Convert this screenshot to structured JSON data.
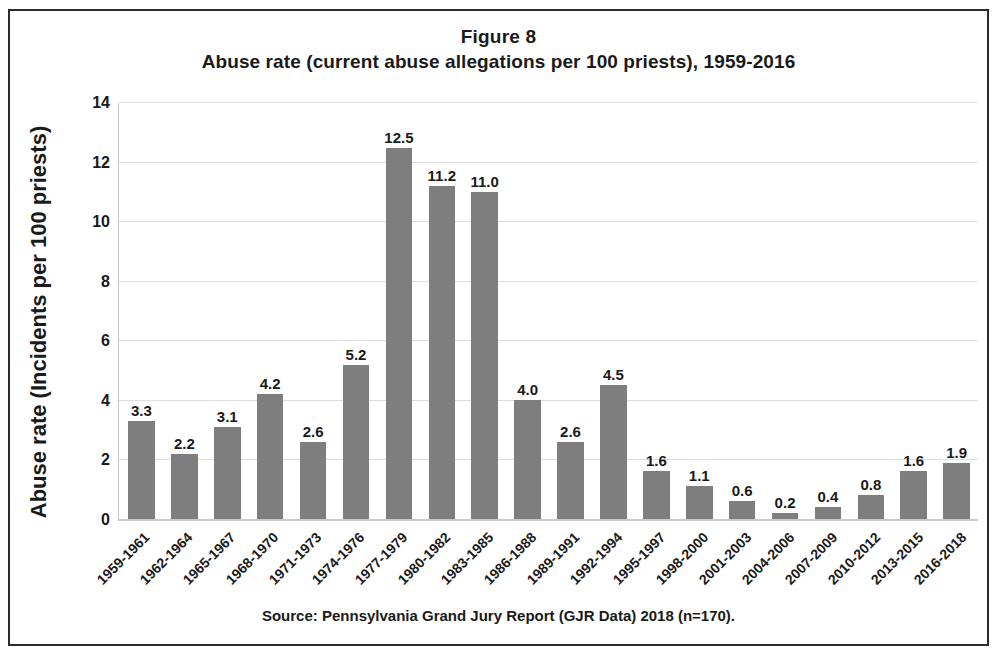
{
  "figure": {
    "number_label": "Figure 8",
    "source_note": "Source: Pennsylvania Grand Jury Report (GJR Data) 2018 (n=170).",
    "y_axis_title": "Abuse rate (Incidents per 100 priests)"
  },
  "chart_data": {
    "type": "bar",
    "title": "Abuse rate (current abuse allegations per 100 priests), 1959-2016",
    "xlabel": "",
    "ylabel": "Abuse rate (Incidents per 100 priests)",
    "ylim": [
      0,
      14
    ],
    "yticks": [
      0,
      2,
      4,
      6,
      8,
      10,
      12,
      14
    ],
    "ytick_labels": [
      "0",
      "2",
      "4",
      "6",
      "8",
      "10",
      "12",
      "14"
    ],
    "grid": true,
    "legend": false,
    "bar_color": "#7e7e7e",
    "categories": [
      "1959-1961",
      "1962-1964",
      "1965-1967",
      "1968-1970",
      "1971-1973",
      "1974-1976",
      "1977-1979",
      "1980-1982",
      "1983-1985",
      "1986-1988",
      "1989-1991",
      "1992-1994",
      "1995-1997",
      "1998-2000",
      "2001-2003",
      "2004-2006",
      "2007-2009",
      "2010-2012",
      "2013-2015",
      "2016-2018"
    ],
    "values": [
      3.3,
      2.2,
      3.1,
      4.2,
      2.6,
      5.2,
      12.5,
      11.2,
      11.0,
      4.0,
      2.6,
      4.5,
      1.6,
      1.1,
      0.6,
      0.2,
      0.4,
      0.8,
      1.6,
      1.9
    ],
    "value_labels": [
      "3.3",
      "2.2",
      "3.1",
      "4.2",
      "2.6",
      "5.2",
      "12.5",
      "11.2",
      "11.0",
      "4.0",
      "2.6",
      "4.5",
      "1.6",
      "1.1",
      "0.6",
      "0.2",
      "0.4",
      "0.8",
      "1.6",
      "1.9"
    ]
  }
}
